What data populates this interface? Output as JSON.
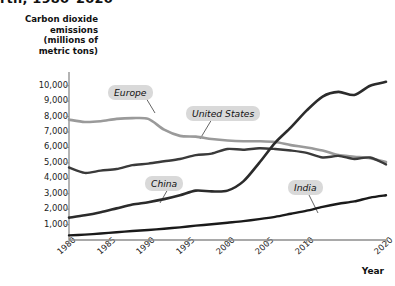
{
  "headline": "rth, 1980–2020",
  "axes": {
    "y_title": "Carbon dioxide emissions (millions of metric tons)",
    "y_title_lines": [
      "Carbon dioxide",
      "emissions",
      "(millions of",
      "metric tons)"
    ],
    "x_title": "Year",
    "y_ticks": [
      "10,000",
      "9,000",
      "8,000",
      "7,000",
      "6,000",
      "5,000",
      "4,000",
      "3,000",
      "2,000",
      "1,000"
    ],
    "x_ticks": [
      "1980",
      "1985",
      "1990",
      "1995",
      "2000",
      "2005",
      "2010",
      "2020"
    ]
  },
  "labels": {
    "europe": "Europe",
    "united_states": "United States",
    "china": "China",
    "india": "India"
  },
  "colors": {
    "europe": "#9a9a9a",
    "united_states": "#3a3a3a",
    "china": "#2b2b2b",
    "india": "#1a1a1a",
    "axis": "#8c8c8c",
    "callout_bg": "#d9d9d9",
    "text": "#1a1a1a"
  },
  "chart_data": {
    "type": "line",
    "title": "rth, 1980–2020",
    "xlabel": "Year",
    "ylabel": "Carbon dioxide emissions (millions of metric tons)",
    "xlim": [
      1980,
      2020
    ],
    "ylim": [
      0,
      10500
    ],
    "grid": false,
    "legend": "inline-callouts",
    "x": [
      1980,
      1982,
      1984,
      1986,
      1988,
      1990,
      1992,
      1994,
      1996,
      1998,
      2000,
      2002,
      2004,
      2006,
      2008,
      2010,
      2012,
      2014,
      2016,
      2018,
      2020
    ],
    "series": [
      {
        "name": "Europe",
        "color": "#9a9a9a",
        "values": [
          7800,
          7650,
          7700,
          7850,
          7900,
          7850,
          7150,
          6750,
          6700,
          6550,
          6450,
          6400,
          6400,
          6350,
          6150,
          6000,
          5800,
          5500,
          5400,
          5300,
          5050
        ]
      },
      {
        "name": "United States",
        "color": "#3a3a3a",
        "values": [
          4700,
          4350,
          4500,
          4600,
          4850,
          4950,
          5100,
          5250,
          5500,
          5600,
          5900,
          5850,
          5950,
          5900,
          5800,
          5650,
          5350,
          5450,
          5250,
          5350,
          4900
        ]
      },
      {
        "name": "China",
        "color": "#2b2b2b",
        "values": [
          1450,
          1600,
          1800,
          2050,
          2300,
          2450,
          2650,
          2900,
          3200,
          3150,
          3200,
          3800,
          5000,
          6300,
          7300,
          8400,
          9300,
          9600,
          9400,
          10000,
          10250
        ]
      },
      {
        "name": "India",
        "color": "#1a1a1a",
        "values": [
          300,
          350,
          420,
          500,
          580,
          650,
          730,
          820,
          930,
          1020,
          1120,
          1220,
          1350,
          1500,
          1700,
          1900,
          2150,
          2350,
          2500,
          2750,
          2900
        ]
      }
    ]
  }
}
